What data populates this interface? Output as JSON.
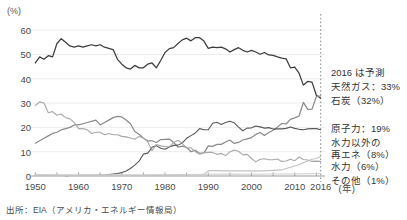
{
  "chart_data": {
    "type": "line",
    "title": "",
    "subtitle": "",
    "ylabel": "(%)",
    "xlabel": "(年)",
    "ylim": [
      0,
      65
    ],
    "xlim": [
      1949,
      2017
    ],
    "yticks": [
      0,
      10,
      20,
      30,
      40,
      50,
      60
    ],
    "xticks": [
      1950,
      1960,
      1970,
      1980,
      1990,
      2000,
      2010,
      2016
    ],
    "grid": "horizontal",
    "legend_position": "right",
    "forecast_marker_year": 2016,
    "annotations": [
      "2016 は予測"
    ],
    "series": [
      {
        "name": "石炭",
        "legend_label": "石炭（32%）",
        "final_value": 32,
        "color": "#3c3c3c",
        "x": [
          1950,
          1951,
          1952,
          1953,
          1954,
          1955,
          1956,
          1957,
          1958,
          1959,
          1960,
          1961,
          1962,
          1963,
          1964,
          1965,
          1966,
          1967,
          1968,
          1969,
          1970,
          1971,
          1972,
          1973,
          1974,
          1975,
          1976,
          1977,
          1978,
          1979,
          1980,
          1981,
          1982,
          1983,
          1984,
          1985,
          1986,
          1987,
          1988,
          1989,
          1990,
          1991,
          1992,
          1993,
          1994,
          1995,
          1996,
          1997,
          1998,
          1999,
          2000,
          2001,
          2002,
          2003,
          2004,
          2005,
          2006,
          2007,
          2008,
          2009,
          2010,
          2011,
          2012,
          2013,
          2014,
          2015,
          2016
        ],
        "values": [
          46.5,
          49.0,
          48.0,
          49.5,
          49.0,
          54.5,
          56.5,
          55.0,
          53.5,
          53.0,
          53.5,
          53.0,
          53.5,
          54.0,
          53.5,
          54.0,
          53.0,
          52.5,
          52.0,
          48.0,
          46.0,
          44.5,
          44.0,
          45.5,
          44.5,
          44.5,
          46.0,
          46.5,
          44.5,
          47.5,
          50.8,
          52.4,
          52.8,
          54.5,
          56.0,
          56.7,
          55.6,
          56.9,
          56.9,
          55.5,
          52.5,
          53.0,
          52.8,
          53.0,
          52.3,
          51.0,
          52.0,
          52.8,
          51.7,
          51.0,
          51.7,
          51.0,
          50.1,
          50.8,
          49.8,
          49.6,
          49.0,
          48.5,
          48.2,
          44.5,
          44.8,
          42.3,
          37.4,
          38.9,
          38.6,
          33.2,
          32.0
        ]
      },
      {
        "name": "天然ガス",
        "legend_label": "天然ガス：33%",
        "final_value": 33,
        "color": "#8a8a8a",
        "x": [
          1950,
          1951,
          1952,
          1953,
          1954,
          1955,
          1956,
          1957,
          1958,
          1959,
          1960,
          1961,
          1962,
          1963,
          1964,
          1965,
          1966,
          1967,
          1968,
          1969,
          1970,
          1971,
          1972,
          1973,
          1974,
          1975,
          1976,
          1977,
          1978,
          1979,
          1980,
          1981,
          1982,
          1983,
          1984,
          1985,
          1986,
          1987,
          1988,
          1989,
          1990,
          1991,
          1992,
          1993,
          1994,
          1995,
          1996,
          1997,
          1998,
          1999,
          2000,
          2001,
          2002,
          2003,
          2004,
          2005,
          2006,
          2007,
          2008,
          2009,
          2010,
          2011,
          2012,
          2013,
          2014,
          2015,
          2016
        ],
        "values": [
          13.5,
          14.5,
          15.5,
          16.5,
          17.5,
          18.0,
          19.0,
          19.5,
          20.0,
          21.0,
          21.0,
          21.5,
          22.0,
          22.5,
          23.0,
          21.0,
          22.0,
          23.0,
          24.0,
          24.5,
          24.3,
          23.0,
          21.5,
          18.3,
          17.2,
          15.5,
          14.5,
          14.5,
          13.8,
          15.0,
          15.1,
          15.2,
          13.8,
          11.9,
          12.3,
          11.8,
          10.0,
          10.6,
          9.3,
          9.5,
          12.4,
          12.2,
          13.0,
          13.0,
          14.0,
          14.8,
          13.4,
          13.8,
          14.8,
          15.3,
          15.8,
          17.1,
          17.9,
          16.7,
          17.9,
          18.8,
          20.1,
          21.6,
          21.4,
          23.3,
          23.9,
          24.7,
          30.3,
          27.4,
          27.5,
          32.7,
          33.0
        ]
      },
      {
        "name": "原子力",
        "legend_label": "原子力：19%",
        "final_value": 19,
        "color": "#585858",
        "x": [
          1957,
          1958,
          1959,
          1960,
          1961,
          1962,
          1963,
          1964,
          1965,
          1966,
          1967,
          1968,
          1969,
          1970,
          1971,
          1972,
          1973,
          1974,
          1975,
          1976,
          1977,
          1978,
          1979,
          1980,
          1981,
          1982,
          1983,
          1984,
          1985,
          1986,
          1987,
          1988,
          1989,
          1990,
          1991,
          1992,
          1993,
          1994,
          1995,
          1996,
          1997,
          1998,
          1999,
          2000,
          2001,
          2002,
          2003,
          2004,
          2005,
          2006,
          2007,
          2008,
          2009,
          2010,
          2011,
          2012,
          2013,
          2014,
          2015,
          2016
        ],
        "values": [
          0.1,
          0.2,
          0.2,
          0.2,
          0.3,
          0.3,
          0.3,
          0.3,
          0.4,
          0.4,
          0.6,
          0.8,
          1.0,
          1.4,
          2.1,
          3.1,
          4.5,
          6.1,
          9.0,
          9.4,
          11.8,
          12.5,
          11.4,
          11.0,
          11.9,
          12.6,
          12.7,
          13.6,
          15.5,
          16.6,
          17.7,
          19.5,
          19.0,
          19.0,
          21.7,
          22.1,
          21.2,
          22.0,
          22.5,
          21.9,
          20.1,
          18.6,
          19.7,
          19.8,
          20.6,
          20.2,
          19.7,
          19.9,
          19.3,
          19.4,
          19.4,
          19.6,
          20.2,
          19.6,
          19.2,
          19.0,
          19.4,
          19.5,
          19.5,
          19.0
        ]
      },
      {
        "name": "水力",
        "legend_label": "水力（6%）",
        "final_value": 6,
        "color": "#a8a8a8",
        "x": [
          1950,
          1951,
          1952,
          1953,
          1954,
          1955,
          1956,
          1957,
          1958,
          1959,
          1960,
          1961,
          1962,
          1963,
          1964,
          1965,
          1966,
          1967,
          1968,
          1969,
          1970,
          1971,
          1972,
          1973,
          1974,
          1975,
          1976,
          1977,
          1978,
          1979,
          1980,
          1981,
          1982,
          1983,
          1984,
          1985,
          1986,
          1987,
          1988,
          1989,
          1990,
          1991,
          1992,
          1993,
          1994,
          1995,
          1996,
          1997,
          1998,
          1999,
          2000,
          2001,
          2002,
          2003,
          2004,
          2005,
          2006,
          2007,
          2008,
          2009,
          2010,
          2011,
          2012,
          2013,
          2014,
          2015,
          2016
        ],
        "values": [
          29.0,
          30.5,
          30.0,
          26.0,
          26.5,
          25.0,
          25.5,
          24.0,
          23.5,
          22.0,
          19.5,
          19.5,
          19.0,
          17.5,
          18.0,
          18.0,
          17.0,
          17.5,
          17.0,
          17.0,
          16.3,
          16.1,
          15.6,
          15.1,
          16.3,
          15.6,
          14.1,
          10.4,
          13.0,
          12.4,
          12.1,
          12.0,
          13.8,
          14.7,
          13.4,
          11.5,
          11.6,
          10.0,
          9.0,
          9.6,
          9.7,
          9.7,
          8.9,
          9.3,
          8.4,
          9.9,
          10.7,
          10.2,
          8.7,
          8.9,
          7.2,
          5.8,
          6.9,
          7.1,
          6.7,
          6.7,
          7.0,
          6.0,
          6.2,
          6.9,
          6.3,
          7.8,
          6.8,
          6.6,
          6.0,
          6.1,
          6.0
        ]
      },
      {
        "name": "水力以外の再エネ",
        "legend_label": "水力以外の再エネ（8%）",
        "legend_label_line1": "水力以外の",
        "legend_label_line2": "再エネ（8%）",
        "final_value": 8,
        "color": "#c2c2c2",
        "x": [
          1950,
          1955,
          1960,
          1965,
          1970,
          1975,
          1980,
          1985,
          1989,
          1990,
          1991,
          1992,
          1993,
          1994,
          1995,
          1996,
          1997,
          1998,
          1999,
          2000,
          2001,
          2002,
          2003,
          2004,
          2005,
          2006,
          2007,
          2008,
          2009,
          2010,
          2011,
          2012,
          2013,
          2014,
          2015,
          2016
        ],
        "values": [
          0.2,
          0.2,
          0.2,
          0.2,
          0.2,
          0.2,
          0.3,
          0.5,
          0.6,
          2.1,
          2.2,
          2.2,
          2.1,
          2.1,
          2.1,
          2.1,
          2.1,
          2.1,
          2.1,
          2.1,
          2.0,
          2.1,
          2.1,
          2.2,
          2.3,
          2.4,
          2.5,
          3.1,
          3.6,
          4.1,
          4.6,
          5.4,
          6.2,
          6.9,
          7.2,
          8.0
        ]
      },
      {
        "name": "その他",
        "legend_label": "その他（1%）",
        "final_value": 1,
        "color": "#cfcfcf",
        "x": [
          1950,
          1960,
          1970,
          1975,
          1980,
          1985,
          1990,
          1995,
          2000,
          2005,
          2010,
          2013,
          2016
        ],
        "values": [
          0.6,
          0.5,
          0.5,
          0.5,
          0.6,
          0.6,
          0.7,
          0.8,
          0.7,
          0.8,
          0.8,
          0.9,
          1.0
        ]
      }
    ]
  },
  "source": {
    "text": "出所：EIA（アメリカ・エネルギー情報局）"
  },
  "legend": {
    "note": "2016 は予測",
    "items": [
      {
        "label": "天然ガス：33%"
      },
      {
        "label": "石炭（32%）"
      },
      {
        "label": "原子力：19%"
      },
      {
        "label": "水力以外の"
      },
      {
        "label": "再エネ（8%）"
      },
      {
        "label": "水力（6%）"
      },
      {
        "label": "その他（1%）"
      }
    ]
  }
}
